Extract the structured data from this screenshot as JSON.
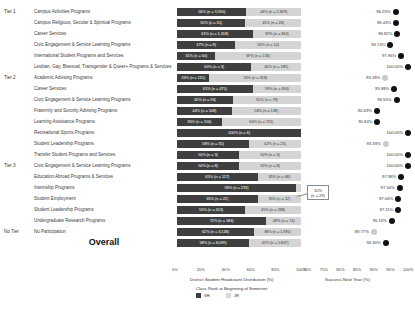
{
  "chart_data": {
    "type": "bar",
    "title": "",
    "panels": {
      "left": {
        "xlabel": "District Student Headcount Distribution (%)",
        "ticks": [
          "0%",
          "20%",
          "40%",
          "60%",
          "80%",
          "100%"
        ],
        "xlim": [
          0,
          100
        ]
      },
      "right": {
        "xlabel": "Success Next Year (%)",
        "ticks": [
          "70%",
          "75%",
          "80%",
          "85%",
          "90%",
          "95%",
          "100%"
        ],
        "xlim": [
          70,
          100
        ]
      }
    },
    "legend": {
      "title": "Class Rank at Beginning of Semester",
      "position": "bottom",
      "entries": [
        {
          "label": "SR",
          "color": "#3f3f3f"
        },
        {
          "label": "JR",
          "color": "#d9d9d9"
        }
      ]
    },
    "series": [
      {
        "name": "SR",
        "color": "#3f3f3f"
      },
      {
        "name": "JR",
        "color": "#d4d4d4"
      }
    ],
    "groups": [
      {
        "tier": "Tier 1",
        "rows": [
          {
            "category": "Campus Activities Programs",
            "sr_pct": 56,
            "sr_label": "56% (n = 3,590)",
            "jr_pct": 44,
            "jr_label": "44% (n = 2,829)",
            "success": 96.25,
            "success_label": "96.25%",
            "muted": false
          },
          {
            "category": "Campus Religious, Secular & Spiritual Programs",
            "sr_pct": 55,
            "sr_label": "55% (n = 31)",
            "jr_pct": 45,
            "jr_label": "45% (n = 26)",
            "success": 96.43,
            "success_label": "96.43%",
            "muted": false
          },
          {
            "category": "Career Services",
            "sr_pct": 61,
            "sr_label": "61% (n = 1,318)",
            "jr_pct": 39,
            "jr_label": "39% (n = 844)",
            "success": 96.82,
            "success_label": "96.82%",
            "muted": false
          },
          {
            "category": "Civic Engagement & Service Learning Programs",
            "sr_pct": 47,
            "sr_label": "47% (n = 8)",
            "jr_pct": 53,
            "jr_label": "53% (n = 10)",
            "success": 94.74,
            "success_label": "94.74%",
            "muted": false
          },
          {
            "category": "International Student Programs and Services",
            "sr_pct": 31,
            "sr_label": "31% (n = 60)",
            "jr_pct": 69,
            "jr_label": "69% (n = 136)",
            "success": 97.96,
            "success_label": "97.96%",
            "muted": false
          },
          {
            "category": "Lesbian, Gay, Bisexual, Transgender & Queer+ Programs & Services",
            "sr_pct": 60,
            "sr_label": "60% (n = 3)",
            "jr_pct": 40,
            "jr_label": "40% (n = 185)",
            "success": 100.0,
            "success_label": "100.00%",
            "muted": false
          }
        ]
      },
      {
        "tier": "Tier 2",
        "rows": [
          {
            "category": "Academic Advising Programs",
            "sr_pct": 26,
            "sr_label": "26% (n = 115)",
            "jr_pct": 74,
            "jr_label": "74% (n = 318)",
            "success": 93.18,
            "success_label": "93.18%",
            "muted": true
          },
          {
            "category": "Career Services",
            "sr_pct": 61,
            "sr_label": "61% (n = 475)",
            "jr_pct": 39,
            "jr_label": "39% (n = 494)",
            "success": 95.88,
            "success_label": "95.88%",
            "muted": false
          },
          {
            "category": "Civic Engagement & Service Learning Programs",
            "sr_pct": 45,
            "sr_label": "45% (n = 94)",
            "jr_pct": 55,
            "jr_label": "55% (n = 78)",
            "success": 96.55,
            "success_label": "96.55%",
            "muted": false
          },
          {
            "category": "Fraternity and Sorority Advising Programs",
            "sr_pct": 44,
            "sr_label": "44% (n = 108)",
            "jr_pct": 56,
            "jr_label": "56% (n = 138)",
            "success": 90.69,
            "success_label": "90.69%",
            "muted": false
          },
          {
            "category": "Learning Assistance Programs",
            "sr_pct": 36,
            "sr_label": "36% (n = 156)",
            "jr_pct": 64,
            "jr_label": "64% (n = 721)",
            "success": 90.84,
            "success_label": "90.84%",
            "muted": false
          },
          {
            "category": "Recreational Sports Programs",
            "sr_pct": 100,
            "sr_label": "100% (n = 6)",
            "jr_pct": 0,
            "jr_label": "",
            "success": 100.0,
            "success_label": "100.00%",
            "muted": false
          },
          {
            "category": "Student Leadership Programs",
            "sr_pct": 58,
            "sr_label": "58% (n = 35)",
            "jr_pct": 42,
            "jr_label": "42% (n = 25)",
            "success": 93.33,
            "success_label": "93.33%",
            "muted": true
          },
          {
            "category": "Transfer Student Programs and Services",
            "sr_pct": 50,
            "sr_label": "50% (n = 3)",
            "jr_pct": 50,
            "jr_label": "50% (n = 3)",
            "success": 100.0,
            "success_label": "100.00%",
            "muted": false
          }
        ]
      },
      {
        "tier": "Tier 3",
        "rows": [
          {
            "category": "Civic Engagement & Service Learning Programs",
            "sr_pct": 50,
            "sr_label": "50% (n = 8)",
            "jr_pct": 50,
            "jr_label": "50% (n = 8)",
            "success": 100.0,
            "success_label": "100.00%",
            "muted": false
          },
          {
            "category": "Education Abroad Programs & Services",
            "sr_pct": 65,
            "sr_label": "65% (n = 127)",
            "jr_pct": 35,
            "jr_label": "35% (n = 68)",
            "success": 97.98,
            "success_label": "97.98%",
            "muted": false
          },
          {
            "category": "Internship Programs",
            "sr_pct": 96,
            "sr_label": "96% (n = 233)",
            "jr_pct": 4,
            "jr_label": "",
            "success": 97.54,
            "success_label": "97.54%",
            "muted": false
          },
          {
            "category": "Student Employment",
            "sr_pct": 65,
            "sr_label": "65% (n = 22)",
            "jr_pct": 35,
            "jr_label": "35% (n = 12)",
            "success": 97.06,
            "success_label": "97.06%",
            "muted": false
          },
          {
            "category": "Student Leadership Programs",
            "sr_pct": 55,
            "sr_label": "55% (n = 413)",
            "jr_pct": 45,
            "jr_label": "45% (n = 288)",
            "success": 97.11,
            "success_label": "97.11%",
            "muted": false
          },
          {
            "category": "Undergraduate Research Programs",
            "sr_pct": 72,
            "sr_label": "72% (n = 184)",
            "jr_pct": 28,
            "jr_label": "28% (n = 74)",
            "success": 95.15,
            "success_label": "95.15%",
            "muted": false
          }
        ]
      },
      {
        "tier": "No Tier",
        "rows": [
          {
            "category": "No Participation",
            "sr_pct": 62,
            "sr_label": "62% (n = 3,148)",
            "jr_pct": 38,
            "jr_label": "38% (n = 1,981)",
            "success": 89.77,
            "success_label": "89.77%",
            "muted": true
          }
        ]
      }
    ],
    "overall": {
      "label": "Overall",
      "sr_pct": 58,
      "sr_label": "58% (n = 8,099)",
      "jr_pct": 42,
      "jr_label": "42% (n = 5,847)",
      "success": 93.3,
      "success_label": "93.30%",
      "muted": false
    },
    "callout": {
      "pct_label": "10%",
      "n_label": "(n = 29)"
    }
  }
}
